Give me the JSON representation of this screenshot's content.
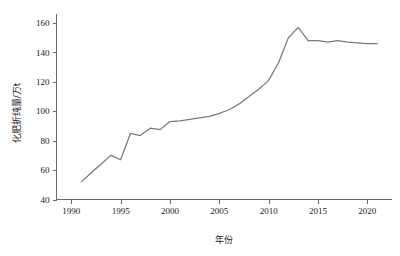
{
  "chart_data": {
    "type": "line",
    "title": "",
    "subtitle": "",
    "xlabel": "年份",
    "ylabel": "化肥折纯量/万t",
    "xlim": [
      1988.5,
      2022.5
    ],
    "ylim": [
      40,
      165
    ],
    "xticks": [
      1990,
      1995,
      2000,
      2005,
      2010,
      2015,
      2020
    ],
    "xtick_labels": [
      "1990",
      "1995",
      "2000",
      "2005",
      "2010",
      "2015",
      "2020"
    ],
    "yticks": [
      40,
      60,
      80,
      100,
      120,
      140,
      160
    ],
    "ytick_labels": [
      "40",
      "60",
      "80",
      "100",
      "120",
      "140",
      "160"
    ],
    "grid": false,
    "legend": false,
    "legend_position": "none",
    "line_color": "#7a7a7a",
    "axis_color": "#6b6b6b",
    "x": [
      1991,
      1992,
      1993,
      1994,
      1995,
      1996,
      1997,
      1998,
      1999,
      2000,
      2001,
      2002,
      2003,
      2004,
      2005,
      2006,
      2007,
      2008,
      2009,
      2010,
      2011,
      2012,
      2013,
      2014,
      2015,
      2016,
      2017,
      2018,
      2019,
      2020,
      2021
    ],
    "series": [
      {
        "name": "化肥折纯量",
        "values": [
          52,
          58,
          64,
          70,
          67,
          85,
          83.5,
          88.5,
          87.5,
          93,
          93.5,
          94.5,
          95.5,
          96.5,
          98.5,
          101,
          105,
          110,
          115,
          121,
          133,
          150,
          157,
          148,
          148,
          147,
          148,
          147,
          146.5,
          146,
          146
        ]
      }
    ],
    "annotations": []
  },
  "axis": {
    "y_title": "化肥折纯量/万t",
    "x_title": "年份"
  }
}
